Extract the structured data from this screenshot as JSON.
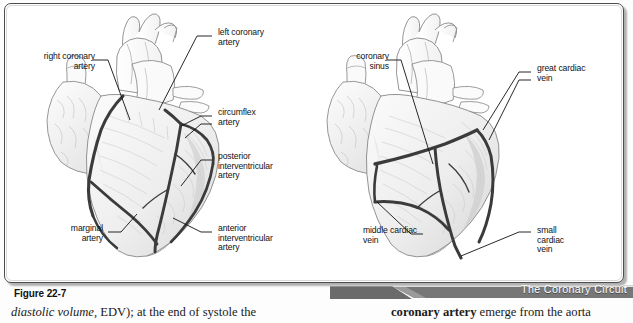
{
  "figure": {
    "caption": "Figure 22-7",
    "banner_title": "The Coronary Circuit",
    "banner_color": "#6b6b6b",
    "vessel_color": "#3b3b3b",
    "frame_color": "#4d4d4d"
  },
  "panels": [
    {
      "id": "anterior",
      "name": "anterior-view-coronary-arteries",
      "labels": [
        {
          "id": "right-coronary-artery",
          "text": "right coronary\nartery"
        },
        {
          "id": "left-coronary-artery",
          "text": "left coronary\nartery"
        },
        {
          "id": "circumflex-artery",
          "text": "circumflex\nartery"
        },
        {
          "id": "posterior-interventricular-artery",
          "text": "posterior\ninterventricular\nartery"
        },
        {
          "id": "anterior-interventricular-artery",
          "text": "anterior\ninterventricular\nartery"
        },
        {
          "id": "marginal-artery",
          "text": "marginal\nartery"
        }
      ]
    },
    {
      "id": "posterior",
      "name": "posterior-view-cardiac-veins",
      "labels": [
        {
          "id": "coronary-sinus",
          "text": "coronary\nsinus"
        },
        {
          "id": "great-cardiac-vein",
          "text": "great cardiac\nvein"
        },
        {
          "id": "small-cardiac-vein",
          "text": "small\ncardiac\nvein"
        },
        {
          "id": "middle-cardiac-vein",
          "text": "middle cardiac\nvein"
        }
      ]
    }
  ],
  "body_text": {
    "left_italic": "diastolic volume,",
    "left_rest": " EDV); at the end of systole the",
    "right_bold": "coronary artery",
    "right_rest": " emerge from the aorta"
  }
}
